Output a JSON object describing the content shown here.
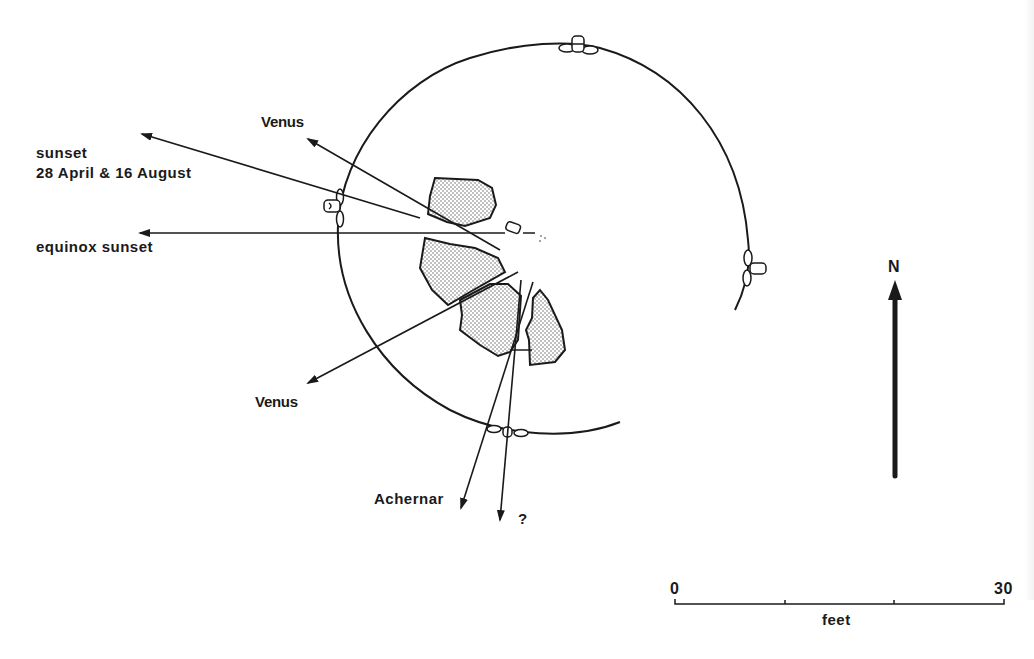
{
  "diagram": {
    "type": "archaeoastronomy site plan (stone circle with sightlines)",
    "sightlines": [
      {
        "label_lines": [
          "sunset",
          "28 April & 16 August"
        ],
        "direction": "west-northwest"
      },
      {
        "label_lines": [
          "Venus"
        ],
        "direction": "northwest"
      },
      {
        "label_lines": [
          "equinox sunset"
        ],
        "direction": "west"
      },
      {
        "label_lines": [
          "Venus"
        ],
        "direction": "southwest"
      },
      {
        "label_lines": [
          "Achernar"
        ],
        "direction": "south-southwest"
      },
      {
        "label_lines": [
          "?"
        ],
        "direction": "south"
      }
    ],
    "labels": {
      "sunset_line1": "sunset",
      "sunset_line2": "28 April & 16 August",
      "venus_nw": "Venus",
      "equinox": "equinox sunset",
      "venus_sw": "Venus",
      "achernar": "Achernar",
      "unknown": "?"
    },
    "north_arrow": {
      "label": "N"
    },
    "scale_bar": {
      "start": "0",
      "end": "30",
      "unit": "feet",
      "ticks": 4
    }
  }
}
